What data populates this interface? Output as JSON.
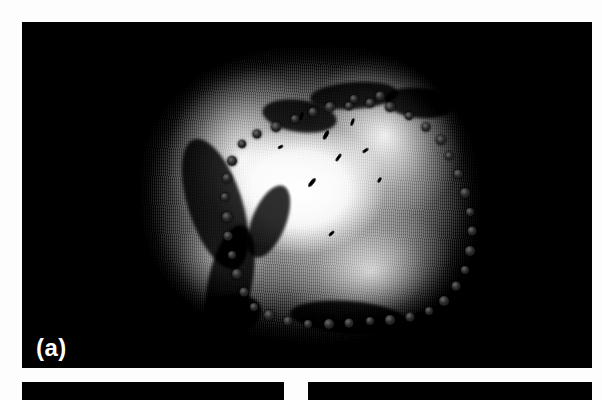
{
  "figure": {
    "panels": [
      {
        "id": "panel-a",
        "label": "(a)",
        "kind": "photograph",
        "subject": "gross pathology specimen with ink-dot margin markers",
        "background_color": "#000000"
      },
      {
        "id": "panel-b",
        "label": "",
        "kind": "photograph",
        "background_color": "#000000"
      },
      {
        "id": "panel-c",
        "label": "",
        "kind": "photograph",
        "background_color": "#000000"
      }
    ],
    "page_background": "#ffffff",
    "marker_color": "#141414",
    "label_color": "#ffffff"
  },
  "markers": {
    "description": "closed ring of dark ink dots tracing the specimen margin",
    "count": 41,
    "points": [
      [
        61.5,
        20.0
      ],
      [
        67.5,
        19.0
      ],
      [
        73.5,
        20.5
      ],
      [
        79.0,
        23.5
      ],
      [
        84.0,
        27.0
      ],
      [
        88.5,
        31.5
      ],
      [
        91.0,
        37.0
      ],
      [
        93.5,
        43.0
      ],
      [
        95.5,
        49.5
      ],
      [
        97.0,
        56.0
      ],
      [
        97.5,
        62.5
      ],
      [
        97.0,
        69.0
      ],
      [
        95.5,
        75.5
      ],
      [
        93.0,
        81.0
      ],
      [
        89.5,
        86.0
      ],
      [
        85.0,
        89.5
      ],
      [
        79.5,
        91.5
      ],
      [
        73.5,
        92.5
      ],
      [
        67.5,
        93.0
      ],
      [
        61.5,
        93.5
      ],
      [
        55.5,
        94.0
      ],
      [
        49.5,
        94.0
      ],
      [
        43.5,
        93.0
      ],
      [
        38.0,
        91.0
      ],
      [
        33.5,
        88.0
      ],
      [
        30.5,
        83.0
      ],
      [
        28.5,
        77.0
      ],
      [
        27.0,
        70.5
      ],
      [
        26.0,
        64.0
      ],
      [
        25.5,
        57.5
      ],
      [
        25.0,
        51.0
      ],
      [
        25.5,
        44.5
      ],
      [
        27.0,
        38.5
      ],
      [
        30.0,
        33.0
      ],
      [
        34.5,
        29.5
      ],
      [
        40.0,
        27.0
      ],
      [
        45.5,
        24.5
      ],
      [
        51.0,
        22.0
      ],
      [
        56.0,
        20.5
      ],
      [
        63.0,
        17.5
      ],
      [
        70.5,
        16.5
      ]
    ]
  },
  "texture": {
    "fissures": [
      [
        14,
        30,
        16,
        46,
        -18
      ],
      [
        20,
        60,
        13,
        40,
        12
      ],
      [
        36,
        18,
        22,
        11,
        8
      ],
      [
        50,
        12,
        26,
        9,
        -4
      ],
      [
        72,
        14,
        20,
        10,
        6
      ],
      [
        44,
        86,
        34,
        11,
        4
      ],
      [
        18,
        84,
        18,
        13,
        -10
      ],
      [
        78,
        88,
        24,
        10,
        -6
      ],
      [
        33,
        46,
        10,
        26,
        22
      ]
    ],
    "flecks": [
      [
        54,
        28,
        4,
        10,
        28
      ],
      [
        58,
        36,
        3,
        9,
        35
      ],
      [
        50,
        44,
        4,
        11,
        40
      ],
      [
        62,
        24,
        3,
        8,
        20
      ],
      [
        66,
        34,
        3,
        7,
        55
      ],
      [
        56,
        62,
        3,
        7,
        48
      ],
      [
        47,
        22,
        3,
        8,
        15
      ],
      [
        41,
        33,
        3,
        6,
        62
      ],
      [
        70,
        44,
        3,
        6,
        30
      ]
    ]
  }
}
